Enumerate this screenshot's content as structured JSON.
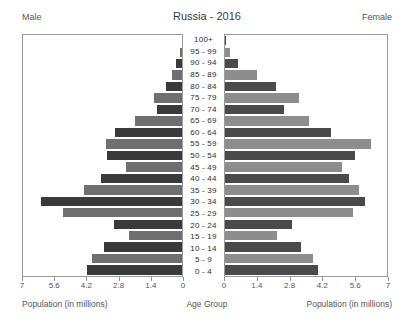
{
  "header": {
    "male_label": "Male",
    "female_label": "Female",
    "title": "Russia - 2016"
  },
  "axis": {
    "male_title": "Population (in millions)",
    "female_title": "Population (in millions)",
    "center_title": "Age Group",
    "ticks_male": [
      "7",
      "5.6",
      "4.2",
      "2.8",
      "1.4",
      "0"
    ],
    "ticks_female": [
      "0",
      "1.4",
      "2.8",
      "4.2",
      "5.6",
      "7"
    ]
  },
  "colors": {
    "bar_dark": "#3a3a3a",
    "bar_light": "#6f6f6f",
    "bar_female_dark": "#4a4a4a",
    "bar_female_light": "#8d8d8d",
    "panel_border": "#9a9a9a",
    "background": "#ffffff",
    "text": "#4a4a4a"
  },
  "chart_data": {
    "type": "bar",
    "title": "Russia - 2016",
    "xlabel": "Population (in millions)",
    "ylabel": "Age Group",
    "xlim": [
      0,
      7
    ],
    "grid": false,
    "legend": [
      "Male",
      "Female"
    ],
    "legend_position": "top-corners",
    "orientation": "horizontal-diverging",
    "categories": [
      "100+",
      "95 - 99",
      "90 - 94",
      "85 - 89",
      "80 - 84",
      "75 - 79",
      "70 - 74",
      "65 - 69",
      "60 - 64",
      "55 - 59",
      "50 - 54",
      "45 - 49",
      "40 - 44",
      "35 - 39",
      "30 - 34",
      "25 - 29",
      "20 - 24",
      "15 - 19",
      "10 - 14",
      "5 - 9",
      "0 - 4"
    ],
    "series": [
      {
        "name": "Male",
        "values": [
          0.02,
          0.08,
          0.28,
          0.45,
          0.72,
          1.25,
          1.1,
          2.05,
          2.95,
          3.35,
          3.3,
          2.45,
          3.55,
          4.3,
          6.2,
          5.25,
          3.0,
          2.35,
          3.45,
          3.95,
          4.2
        ]
      },
      {
        "name": "Female",
        "values": [
          0.05,
          0.22,
          0.55,
          1.4,
          2.2,
          3.2,
          2.55,
          3.65,
          4.6,
          6.3,
          5.6,
          5.05,
          5.35,
          5.8,
          6.05,
          5.55,
          2.9,
          2.25,
          3.3,
          3.8,
          4.0
        ]
      }
    ]
  }
}
